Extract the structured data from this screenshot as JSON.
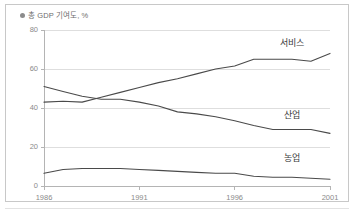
{
  "figure": {
    "title": "총 GDP 기여도, %",
    "title_marker_icon": "bullet-icon",
    "border_color": "#c8c8c8",
    "background_color": "#ffffff"
  },
  "chart_data": {
    "type": "line",
    "title": "총 GDP 기여도, %",
    "xlabel": "",
    "ylabel": "",
    "xlim": [
      1986,
      2001
    ],
    "ylim": [
      0,
      80
    ],
    "ytick_values": [
      0,
      20,
      40,
      60,
      80
    ],
    "ytick_labels": [
      "0",
      "20",
      "40",
      "60",
      "80"
    ],
    "xtick_values": [
      1986,
      1991,
      1996,
      2001
    ],
    "xtick_labels": [
      "1986",
      "1991",
      "1996",
      "2001"
    ],
    "grid": "horizontal",
    "legend_position": "inline-right",
    "line_color": "#4a4a4a",
    "grid_color": "#dedede",
    "axis_color": "#b4b4b4",
    "x": [
      1986,
      1987,
      1988,
      1989,
      1990,
      1991,
      1992,
      1993,
      1994,
      1995,
      1996,
      1997,
      1998,
      1999,
      2000,
      2001
    ],
    "series": [
      {
        "name": "서비스",
        "label": "서비스",
        "values": [
          43,
          43.5,
          43,
          45.5,
          48,
          50.5,
          53,
          55,
          57.5,
          60,
          61.5,
          65,
          65,
          65,
          64,
          68
        ]
      },
      {
        "name": "산업",
        "label": "산업",
        "values": [
          51,
          48.5,
          46,
          44.5,
          44.5,
          43,
          41,
          38,
          37,
          35.5,
          33.5,
          31,
          29,
          29,
          29,
          27
        ]
      },
      {
        "name": "농업",
        "label": "농업",
        "values": [
          6.5,
          8.5,
          9,
          9,
          9,
          8.5,
          8,
          7.5,
          7,
          6.5,
          6.5,
          5,
          4.5,
          4.5,
          4,
          3.5
        ]
      }
    ],
    "annotations": [
      {
        "text": "서비스",
        "x": 1998.4,
        "y": 73
      },
      {
        "text": "산업",
        "x": 1998.6,
        "y": 36
      },
      {
        "text": "농업",
        "x": 1998.6,
        "y": 14
      }
    ]
  }
}
